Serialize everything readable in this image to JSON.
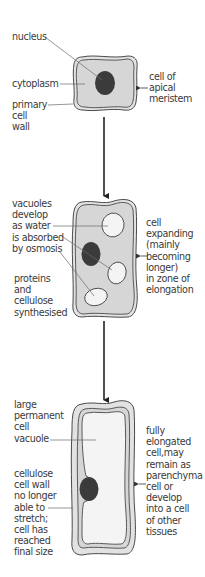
{
  "diagram": {
    "colors": {
      "cytoplasm": "#d6d6d6",
      "cell_wall_fill": "#e2e2e2",
      "vacuole": "#f4f4f4",
      "nucleus": "#3b3b3b",
      "outline": "#4a4a4a",
      "text": "#3a3a3a",
      "leader_line": "#6a6a6a"
    },
    "stages": [
      {
        "name": "apical-meristem",
        "side_label": "cell of\napical\nmeristem",
        "labels": [
          {
            "text": "nucleus",
            "points_to": "nucleus"
          },
          {
            "text": "cytoplasm",
            "points_to": "cytoplasm"
          },
          {
            "text": "primary\ncell\nwall",
            "points_to": "cell wall"
          }
        ]
      },
      {
        "name": "zone-of-elongation",
        "side_label": "cell\nexpanding\n(mainly\nbecoming\nlonger)\nin zone of\nelongation",
        "labels": [
          {
            "text": "vacuoles\ndevelop\nas water\nis absorbed\nby osmosis",
            "points_to": "vacuoles"
          },
          {
            "text": "proteins\nand\ncellulose\nsynthesised",
            "points_to": "vacuole"
          }
        ]
      },
      {
        "name": "fully-elongated",
        "side_label": "fully\nelongated\ncell,may\nremain as\nparenchyma\ncell or\ndevelop\ninto a cell\nof other\ntissues",
        "labels": [
          {
            "text": "large\npermanent\ncell\nvacuole",
            "points_to": "large vacuole"
          },
          {
            "text": "cellulose\ncell wall\nno longer\nable to\nstretch;\ncell has\nreached\nfinal size",
            "points_to": "cell wall"
          }
        ]
      }
    ],
    "arrows": [
      {
        "from": "apical-meristem",
        "to": "zone-of-elongation"
      },
      {
        "from": "zone-of-elongation",
        "to": "fully-elongated"
      }
    ]
  }
}
